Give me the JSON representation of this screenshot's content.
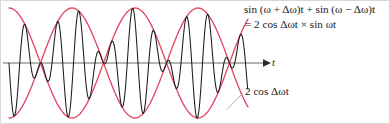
{
  "figure": {
    "title_none": "",
    "formula": {
      "line1": "sin (ω + Δω)t + sin (ω − Δω)t",
      "line2": "= 2 cos Δωt × sin ωt"
    },
    "envelope_label": "2 cos Δωt",
    "axis_label": "t",
    "colors": {
      "envelope": "#e04a64",
      "carrier": "#1a1a1a",
      "axis": "#6b6b6b",
      "leader": "#9a9a9a",
      "frame": "#d8d8d8",
      "background": "#ffffff"
    }
  },
  "chart_data": {
    "type": "line",
    "title": "",
    "xlabel": "t",
    "ylabel": "",
    "grid": false,
    "legend_position": "inline-annotations",
    "axis": {
      "baseline_y": 62,
      "x_start": 2,
      "x_end": 266,
      "arrow": true
    },
    "geometry": {
      "x_start_px": 8,
      "x_end_px": 247,
      "baseline_px": 62,
      "amplitude_px": 55,
      "envelope_period_px": 126,
      "envelope_peaks_px": [
        8,
        134,
        247
      ],
      "envelope_nodes_px": [
        71,
        197
      ],
      "carrier_period_px": 21.5,
      "carrier_cycles": 11.2
    },
    "series": [
      {
        "name": "2 cos Δωt",
        "role": "upper-envelope",
        "color": "#e04a64",
        "formula": "y = 2 cos(Δω t)",
        "amplitude": 2,
        "angular_frequency_rel": 1
      },
      {
        "name": "−2 cos Δωt",
        "role": "lower-envelope",
        "color": "#e04a64",
        "formula": "y = −2 cos(Δω t)",
        "amplitude": 2,
        "angular_frequency_rel": 1
      },
      {
        "name": "sin (ω + Δω)t + sin (ω − Δω)t",
        "role": "carrier-beat",
        "color": "#1a1a1a",
        "formula": "y = 2 cos(Δω t) × sin(ω t)",
        "amplitude": 2,
        "angular_frequency_rel": 11.2
      }
    ],
    "annotations": [
      {
        "text": "sin (ω + Δω)t + sin (ω − Δω)t = 2 cos Δωt × sin ωt",
        "target": "carrier-beat",
        "position": "top-right"
      },
      {
        "text": "2 cos Δωt",
        "target": "lower-envelope",
        "position": "bottom-right",
        "leader_line": true
      }
    ]
  }
}
